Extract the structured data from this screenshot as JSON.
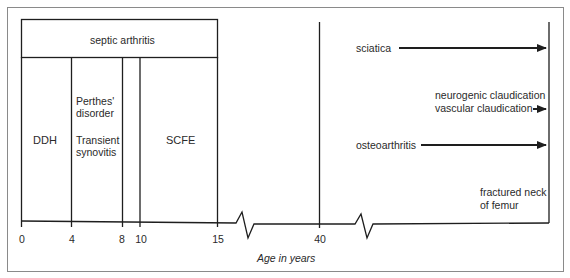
{
  "axis": {
    "title": "Age in years",
    "ticks": [
      "0",
      "4",
      "8",
      "10",
      "15",
      "40"
    ]
  },
  "childhood": {
    "spanning_condition": "septic arthritis",
    "conditions": [
      {
        "label": "DDH",
        "range": "0–4"
      },
      {
        "label": "Perthes' disorder",
        "line1": "Perthes'",
        "line2": "disorder",
        "range": "4–8"
      },
      {
        "label": "Transient synovitis",
        "line1": "Transient",
        "line2": "synovitis",
        "range": "4–8"
      },
      {
        "label": "SCFE",
        "range": "10–15"
      }
    ]
  },
  "adult": {
    "conditions": [
      {
        "label": "sciatica",
        "start_age": "40",
        "arrow": true
      },
      {
        "label_line1": "neurogenic claudication",
        "label_line2": "vascular claudication",
        "arrow": true
      },
      {
        "label": "osteoarthritis",
        "start_age": "40",
        "arrow": true
      },
      {
        "label_line1": "fractured neck",
        "label_line2": "of femur",
        "arrow": false
      }
    ]
  },
  "colors": {
    "line": "#1e1e1e",
    "frame": "#8a8a8a",
    "text": "#2a2a2a"
  }
}
